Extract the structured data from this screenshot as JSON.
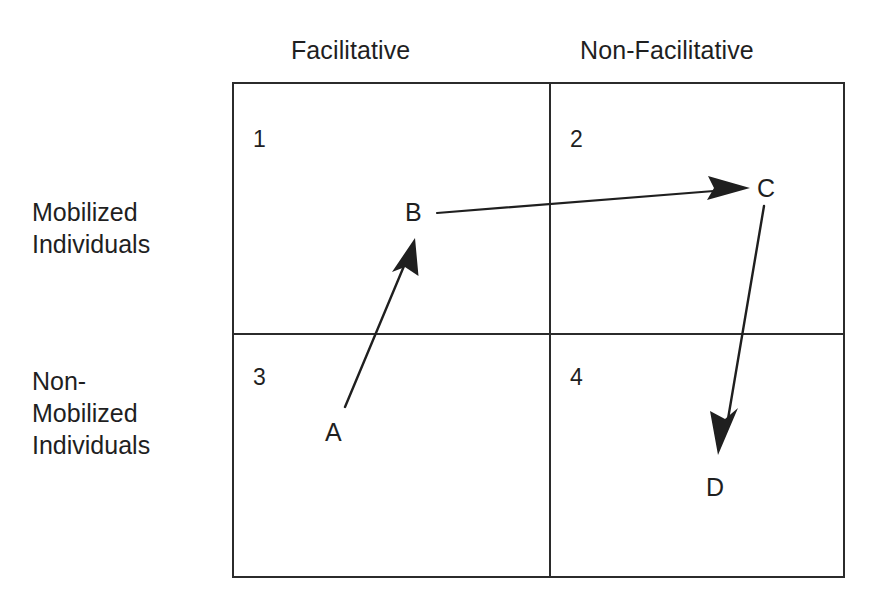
{
  "diagram": {
    "type": "two-by-two-matrix",
    "columns": [
      {
        "id": "facilitative",
        "label": "Facilitative"
      },
      {
        "id": "non-facilitative",
        "label": "Non-Facilitative"
      }
    ],
    "rows": [
      {
        "id": "mobilized",
        "label": "Mobilized\nIndividuals"
      },
      {
        "id": "non-mobilized",
        "label": "Non-\nMobilized\nIndividuals"
      }
    ],
    "quadrants": [
      {
        "number": "1",
        "row": "mobilized",
        "column": "facilitative"
      },
      {
        "number": "2",
        "row": "mobilized",
        "column": "non-facilitative"
      },
      {
        "number": "3",
        "row": "non-mobilized",
        "column": "facilitative"
      },
      {
        "number": "4",
        "row": "non-mobilized",
        "column": "non-facilitative"
      }
    ],
    "nodes": [
      {
        "id": "a",
        "label": "A",
        "quadrant": "3"
      },
      {
        "id": "b",
        "label": "B",
        "quadrant": "1"
      },
      {
        "id": "c",
        "label": "C",
        "quadrant": "2"
      },
      {
        "id": "d",
        "label": "D",
        "quadrant": "4"
      }
    ],
    "arrows": [
      {
        "id": "a-to-b",
        "from": "A",
        "to": "B"
      },
      {
        "id": "b-to-c",
        "from": "B",
        "to": "C"
      },
      {
        "id": "c-to-d",
        "from": "C",
        "to": "D"
      }
    ],
    "colors": {
      "line": "#2b2b2b",
      "text": "#1f1f1f",
      "background": "#ffffff"
    }
  }
}
